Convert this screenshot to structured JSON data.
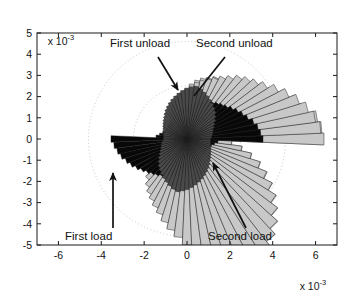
{
  "figure": {
    "title": "",
    "y_exponent_prefix": "x 10",
    "y_exponent_power": "-3",
    "x_exponent_prefix": "x 10",
    "x_exponent_power": "-3"
  },
  "annotations": [
    {
      "name": "first-unload",
      "text": "First unload",
      "x": 110,
      "y": 47,
      "anchor": "start",
      "leader": {
        "x1": 158,
        "y1": 57,
        "x2": 178,
        "y2": 90
      },
      "arrow": true
    },
    {
      "name": "second-unload",
      "text": "Second unload",
      "x": 196,
      "y": 47,
      "anchor": "start",
      "leader": {
        "x1": 225,
        "y1": 57,
        "x2": 194,
        "y2": 96
      },
      "arrow": false
    },
    {
      "name": "first-load",
      "text": "First  load",
      "x": 65,
      "y": 240,
      "anchor": "start",
      "leader": {
        "x1": 113,
        "y1": 228,
        "x2": 113,
        "y2": 173
      },
      "arrow": true
    },
    {
      "name": "second-load",
      "text": "Second load",
      "x": 208,
      "y": 240,
      "anchor": "start",
      "leader": {
        "x1": 246,
        "y1": 228,
        "x2": 213,
        "y2": 163
      },
      "arrow": true
    }
  ],
  "colors": {
    "axis": "#1a1a1a",
    "grid_dotted": "#b9b9b9",
    "text": "#111111",
    "series_light": "#c8c8c8",
    "series_black": "#080808",
    "series_dark_gray": "#4a4a4a",
    "series_mid_gray": "#8e8e8e",
    "background": "#ffffff",
    "edge": "#1a1a1a"
  },
  "chart_data": {
    "type": "bar",
    "subtype": "polar-rose-histogram",
    "title": "",
    "xlabel": "",
    "ylabel": "",
    "xlim": [
      -7,
      7
    ],
    "ylim": [
      -5,
      5
    ],
    "x_ticks": [
      -6,
      -4,
      -2,
      0,
      2,
      4,
      6
    ],
    "x_tick_labels": [
      "-6",
      "-4",
      "-2",
      "0",
      "2",
      "4",
      "6"
    ],
    "y_ticks": [
      -5,
      -4,
      -3,
      -2,
      -1,
      0,
      1,
      2,
      3,
      4,
      5
    ],
    "y_tick_labels": [
      "-5",
      "-4",
      "-3",
      "-2",
      "-1",
      "0",
      "1",
      "2",
      "3",
      "4",
      "5"
    ],
    "x_scale_factor": 0.001,
    "y_scale_factor": 0.001,
    "grid": "dotted-polar-circles",
    "grid_circle_radii": [
      2.5,
      4.6
    ],
    "legend": "none",
    "angular_bin_count": 72,
    "angular_bin_width_deg": 5,
    "series": [
      {
        "name": "First load",
        "color": "#c8c8c8",
        "order": 1,
        "radii": [
          6.35,
          6.3,
          6.15,
          5.6,
          5.45,
          5.1,
          4.55,
          4.35,
          4.15,
          3.95,
          3.75,
          3.5,
          3.3,
          3.2,
          3.05,
          2.95,
          2.8,
          2.6,
          2.4,
          2.2,
          2.05,
          1.9,
          1.75,
          1.6,
          1.45,
          1.35,
          1.25,
          1.15,
          1.05,
          1.0,
          0.95,
          0.9,
          0.88,
          0.86,
          0.85,
          0.84,
          0.85,
          0.9,
          1.0,
          1.15,
          1.35,
          1.6,
          1.85,
          2.1,
          2.35,
          2.6,
          2.85,
          3.05,
          3.25,
          3.45,
          3.7,
          4.0,
          4.3,
          4.6,
          4.95,
          5.3,
          5.6,
          5.9,
          6.15,
          6.3,
          6.38,
          6.3,
          6.1,
          5.75,
          5.35,
          4.95,
          4.5,
          4.05,
          3.6,
          3.1,
          2.6,
          2.1
        ]
      },
      {
        "name": "Second load",
        "color": "#c8c8c8",
        "order": 2,
        "radii": [
          6.4,
          6.25,
          6.05,
          5.8,
          5.5,
          5.15,
          4.8,
          4.45,
          4.2,
          4.0,
          3.8,
          3.55,
          3.35,
          3.15,
          3.0,
          2.85,
          2.7,
          2.5,
          2.3,
          2.15,
          2.0,
          1.85,
          1.7,
          1.55,
          1.42,
          1.3,
          1.2,
          1.12,
          1.04,
          0.98,
          0.93,
          0.9,
          0.87,
          0.85,
          0.84,
          0.84,
          0.86,
          0.92,
          1.02,
          1.18,
          1.38,
          1.62,
          1.88,
          2.12,
          2.38,
          2.62,
          2.88,
          3.1,
          3.3,
          3.52,
          3.75,
          4.05,
          4.35,
          4.65,
          5.0,
          5.35,
          5.65,
          5.95,
          6.18,
          6.32,
          6.4,
          6.28,
          6.08,
          5.72,
          5.32,
          4.92,
          4.48,
          4.02,
          3.58,
          3.08,
          2.58,
          2.08
        ]
      },
      {
        "name": "First unload",
        "color": "#080808",
        "order": 3,
        "radii": [
          3.55,
          3.45,
          3.35,
          3.2,
          3.0,
          2.85,
          2.7,
          2.55,
          2.4,
          2.3,
          2.2,
          2.1,
          2.0,
          1.92,
          1.85,
          1.78,
          1.7,
          1.62,
          1.55,
          1.48,
          1.42,
          1.36,
          1.3,
          1.25,
          1.2,
          1.16,
          1.12,
          1.1,
          1.08,
          1.06,
          1.05,
          1.06,
          1.1,
          1.18,
          1.3,
          1.45,
          3.55,
          3.42,
          3.3,
          3.18,
          3.02,
          2.88,
          2.72,
          2.56,
          2.42,
          2.3,
          2.2,
          2.1,
          2.0,
          1.92,
          1.85,
          1.78,
          1.7,
          1.62,
          1.55,
          1.48,
          1.42,
          1.36,
          1.3,
          1.25,
          1.2,
          1.16,
          1.12,
          1.1,
          1.08,
          1.06,
          1.05,
          1.06,
          1.1,
          1.18,
          1.3,
          1.45
        ]
      },
      {
        "name": "Second unload",
        "color": "#4a4a4a",
        "order": 4,
        "radii": [
          1.1,
          1.15,
          1.2,
          1.25,
          1.3,
          1.38,
          1.48,
          1.6,
          1.72,
          1.85,
          1.95,
          2.05,
          2.15,
          2.25,
          2.35,
          2.45,
          2.52,
          2.45,
          2.38,
          2.3,
          2.2,
          2.1,
          2.0,
          1.9,
          1.8,
          1.7,
          1.6,
          1.5,
          1.42,
          1.34,
          1.28,
          1.22,
          1.18,
          1.14,
          1.12,
          1.1,
          1.1,
          1.15,
          1.2,
          1.25,
          1.3,
          1.38,
          1.48,
          1.6,
          1.72,
          1.85,
          1.95,
          2.05,
          2.15,
          2.25,
          2.35,
          2.45,
          2.52,
          2.45,
          2.38,
          2.3,
          2.2,
          2.1,
          2.0,
          1.9,
          1.8,
          1.7,
          1.6,
          1.5,
          1.42,
          1.34,
          1.28,
          1.22,
          1.18,
          1.14,
          1.12,
          1.1
        ]
      }
    ]
  }
}
